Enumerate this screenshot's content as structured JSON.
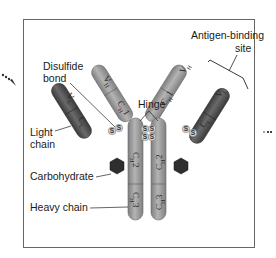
{
  "diagram": {
    "labels": {
      "antigen_binding_site_line1": "Antigen-binding",
      "antigen_binding_site_line2": "site",
      "disulfide_bond_line1": "Disulfide",
      "disulfide_bond_line2": "bond",
      "hinge": "Hinge",
      "light_chain_line1": "Light",
      "light_chain_line2": "chain",
      "carbohydrate": "Carbohydrate",
      "heavy_chain": "Heavy chain"
    },
    "domains": {
      "vh": {
        "main": "V",
        "sub": "H"
      },
      "ch1": {
        "main": "C",
        "sub": "H",
        "num": "1"
      },
      "ch2": {
        "main": "C",
        "sub": "H",
        "num": "2"
      },
      "ch3": {
        "main": "C",
        "sub": "H",
        "num": "3"
      },
      "vl": {
        "main": "V",
        "sub": "L"
      },
      "cl": {
        "main": "C",
        "sub": "L"
      }
    },
    "sulfur_symbol": "S",
    "colors": {
      "heavy_chain": "#9a9a9a",
      "light_chain": "#555555",
      "carbohydrate": "#2e2e2e",
      "disulfide": "#c8c8c8",
      "border": "#666666"
    }
  }
}
